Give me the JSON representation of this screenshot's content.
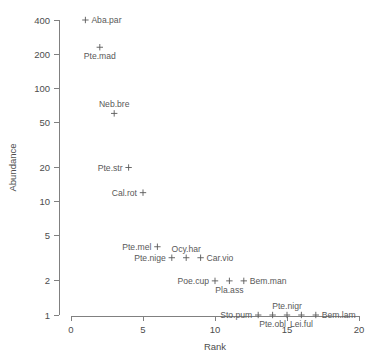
{
  "chart_data": {
    "type": "scatter",
    "title": "",
    "xlabel": "Rank",
    "ylabel": "Abundance",
    "xlim": [
      0,
      20
    ],
    "ylim": [
      1,
      400
    ],
    "yscale": "log",
    "xscale": "linear",
    "grid": false,
    "legend": null,
    "marker_symbol": "+",
    "xticks": [
      0,
      5,
      10,
      15,
      20
    ],
    "xticklabels": [
      "0",
      "5",
      "10",
      "15",
      "20"
    ],
    "yticks": [
      1,
      2,
      5,
      10,
      20,
      50,
      100,
      200,
      400
    ],
    "yticklabels": [
      "1",
      "2",
      "5",
      "10",
      "20",
      "50",
      "100",
      "200",
      "400"
    ],
    "points": [
      {
        "label": "Aba.par",
        "rank": 1,
        "abundance": 400,
        "label_pos": "right"
      },
      {
        "label": "Pte.mad",
        "rank": 2,
        "abundance": 230,
        "label_pos": "below"
      },
      {
        "label": "Neb.bre",
        "rank": 3,
        "abundance": 60,
        "label_pos": "above"
      },
      {
        "label": "Pte.str",
        "rank": 4,
        "abundance": 20,
        "label_pos": "left"
      },
      {
        "label": "Cal.rot",
        "rank": 5,
        "abundance": 12,
        "label_pos": "left"
      },
      {
        "label": "Pte.mel",
        "rank": 6,
        "abundance": 4,
        "label_pos": "left"
      },
      {
        "label": "Pte.nige",
        "rank": 7,
        "abundance": 3.2,
        "label_pos": "left"
      },
      {
        "label": "Ocy.har",
        "rank": 8,
        "abundance": 3.2,
        "label_pos": "above"
      },
      {
        "label": "Car.vio",
        "rank": 9,
        "abundance": 3.2,
        "label_pos": "right"
      },
      {
        "label": "Poe.cup",
        "rank": 10,
        "abundance": 2,
        "label_pos": "left"
      },
      {
        "label": "Pla.ass",
        "rank": 11,
        "abundance": 2,
        "label_pos": "below"
      },
      {
        "label": "Bem.man",
        "rank": 12,
        "abundance": 2,
        "label_pos": "right"
      },
      {
        "label": "Sto.pum",
        "rank": 13,
        "abundance": 1,
        "label_pos": "left"
      },
      {
        "label": "Pte.obl",
        "rank": 14,
        "abundance": 1,
        "label_pos": "below"
      },
      {
        "label": "Pte.nigr",
        "rank": 15,
        "abundance": 1,
        "label_pos": "above"
      },
      {
        "label": "Lei.ful",
        "rank": 16,
        "abundance": 1,
        "label_pos": "below"
      },
      {
        "label": "Bem.lam",
        "rank": 17,
        "abundance": 1,
        "label_pos": "right"
      }
    ]
  },
  "colors": {
    "axis": "#808080",
    "tick_text": "#4d4d4d",
    "marker": "#595959",
    "label": "#595959",
    "background": "#ffffff"
  }
}
